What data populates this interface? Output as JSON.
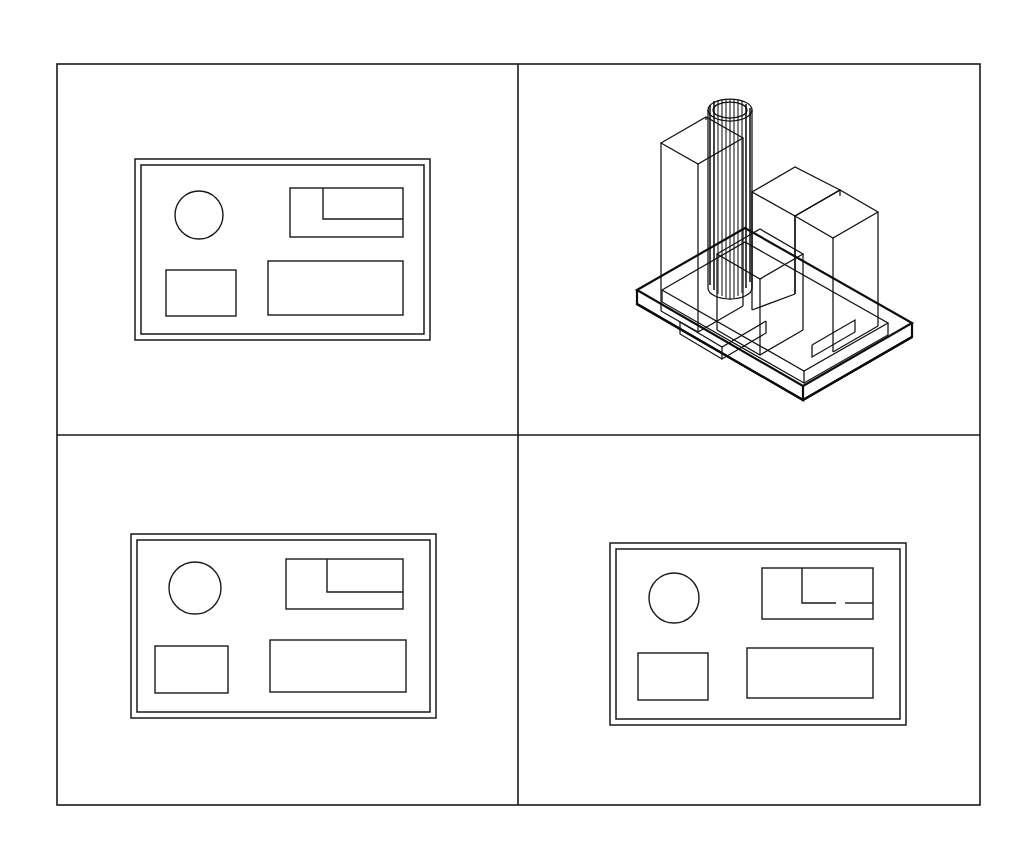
{
  "document": {
    "title": "CAD Multi-View Drawing",
    "background_color": "#ffffff",
    "line_color": "#1a1a1a",
    "width": 1016,
    "height": 851
  },
  "frame": {
    "name": "outer-drawing-border",
    "x": 57,
    "y": 64,
    "width": 923,
    "height": 741,
    "stroke_color": "#1a1a1a"
  },
  "dividers": {
    "vertical_x": 518,
    "horizontal_y": 435
  },
  "viewports": [
    {
      "id": "top-left",
      "label": "Top Plan View",
      "view_type": "orthographic-plan",
      "quadrant": "upper-left"
    },
    {
      "id": "top-right",
      "label": "Isometric Wireframe View",
      "view_type": "isometric-3d",
      "quadrant": "upper-right"
    },
    {
      "id": "bottom-left",
      "label": "Front Plan View",
      "view_type": "orthographic-plan",
      "quadrant": "lower-left"
    },
    {
      "id": "bottom-right",
      "label": "Side Plan View",
      "view_type": "orthographic-plan",
      "quadrant": "lower-right"
    }
  ],
  "plans": {
    "top_left": {
      "name": "floor-plan-top-left",
      "wall_outer": {
        "x": 135,
        "y": 159,
        "width": 295,
        "height": 181
      },
      "wall_inner": {
        "x": 141,
        "y": 165,
        "width": 283,
        "height": 169
      },
      "circle": {
        "cx": 199,
        "cy": 215,
        "r": 24
      },
      "notched_rect": {
        "x": 290,
        "y": 188,
        "width": 113,
        "height": 49
      },
      "notch_divider": {
        "x": 323,
        "y": 188,
        "inner_y": 219,
        "end_x": 403
      },
      "small_rect": {
        "x": 166,
        "y": 270,
        "width": 70,
        "height": 46
      },
      "large_rect": {
        "x": 268,
        "y": 261,
        "width": 135,
        "height": 54
      },
      "divider_gap": false
    },
    "bottom_left": {
      "name": "floor-plan-bottom-left",
      "wall_outer": {
        "x": 131,
        "y": 534,
        "width": 305,
        "height": 184
      },
      "wall_inner": {
        "x": 137,
        "y": 540,
        "width": 293,
        "height": 172
      },
      "circle": {
        "cx": 195,
        "cy": 588,
        "r": 26
      },
      "notched_rect": {
        "x": 286,
        "y": 559,
        "width": 117,
        "height": 50
      },
      "notch_divider": {
        "x": 327,
        "y": 559,
        "inner_y": 592,
        "end_x": 403
      },
      "small_rect": {
        "x": 155,
        "y": 646,
        "width": 73,
        "height": 47
      },
      "large_rect": {
        "x": 270,
        "y": 640,
        "width": 136,
        "height": 52
      },
      "divider_gap": false
    },
    "bottom_right": {
      "name": "floor-plan-bottom-right",
      "wall_outer": {
        "x": 610,
        "y": 543,
        "width": 296,
        "height": 182
      },
      "wall_inner": {
        "x": 616,
        "y": 549,
        "width": 284,
        "height": 170
      },
      "circle": {
        "cx": 674,
        "cy": 598,
        "r": 25
      },
      "notched_rect": {
        "x": 762,
        "y": 568,
        "width": 111,
        "height": 51
      },
      "notch_divider": {
        "x": 802,
        "y": 568,
        "inner_y": 603,
        "end_x": 873
      },
      "small_rect": {
        "x": 638,
        "y": 653,
        "width": 70,
        "height": 47
      },
      "large_rect": {
        "x": 747,
        "y": 648,
        "width": 126,
        "height": 50
      },
      "divider_gap": true,
      "gap_start_x": 836,
      "gap_end_x": 845
    }
  },
  "isometric": {
    "name": "isometric-extrusion-model",
    "origin": {
      "x": 770,
      "y": 300
    },
    "description": "Wireframe isometric extrusion of the floor plan with cylinder and rectangular prisms on a base slab",
    "elements": [
      {
        "name": "base-slab",
        "type": "slab",
        "height": 14
      },
      {
        "name": "cylinder-column",
        "type": "cylinder",
        "radius": 22,
        "height": 205,
        "hatch_lines": 13
      },
      {
        "name": "tall-box-left",
        "type": "box",
        "height": 185
      },
      {
        "name": "tall-box-right",
        "type": "box",
        "height": 145
      },
      {
        "name": "short-box-right",
        "type": "box",
        "height": 115
      },
      {
        "name": "low-box-center",
        "type": "box",
        "height": 75
      }
    ]
  }
}
